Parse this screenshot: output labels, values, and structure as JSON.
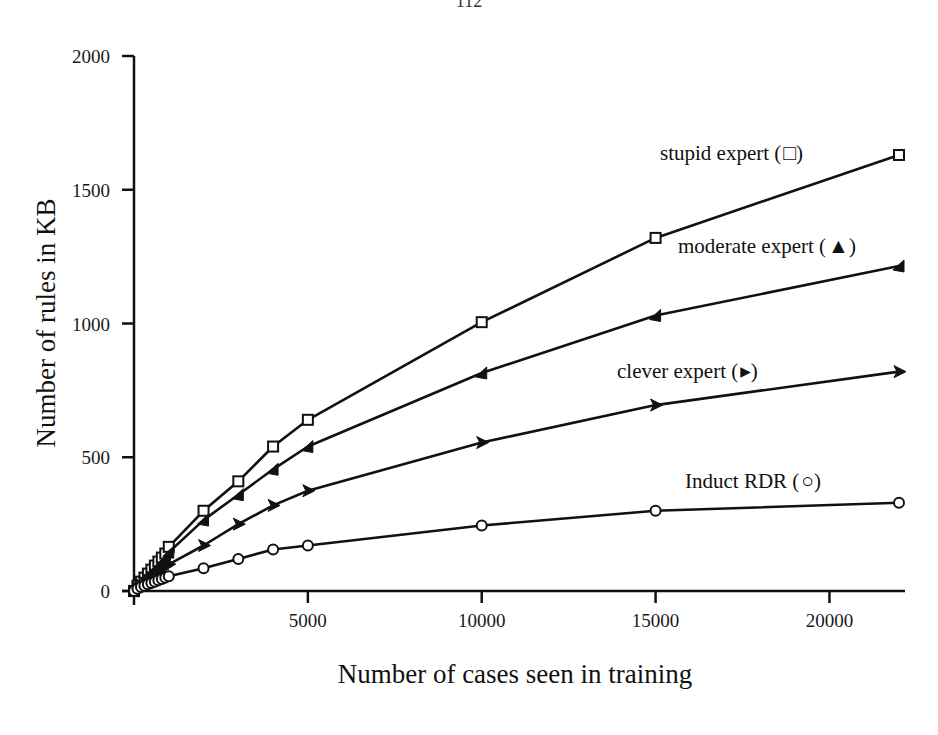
{
  "page": {
    "number": "112"
  },
  "chart_data": {
    "type": "line",
    "title": "",
    "xlabel": "Number of cases seen in training",
    "ylabel": "Number of rules in KB",
    "xlim": [
      0,
      22000
    ],
    "ylim": [
      0,
      2000
    ],
    "xticks": [
      5000,
      10000,
      15000,
      20000
    ],
    "xtick_labels": [
      "5000",
      "10000",
      "15000",
      "20000"
    ],
    "yticks": [
      0,
      500,
      1000,
      1500,
      2000
    ],
    "ytick_labels": [
      "0",
      "500",
      "1000",
      "1500",
      "2000"
    ],
    "grid": false,
    "legend_position": "inline labels at right of each line",
    "series": [
      {
        "name": "stupid expert",
        "label": "stupid expert (□)",
        "marker": "square",
        "x": [
          0,
          100,
          200,
          300,
          400,
          500,
          600,
          700,
          800,
          900,
          1000,
          2000,
          3000,
          4000,
          5000,
          10000,
          15000,
          22000
        ],
        "y": [
          0,
          20,
          35,
          50,
          65,
          80,
          95,
          110,
          125,
          140,
          165,
          300,
          410,
          540,
          640,
          1005,
          1320,
          1630
        ]
      },
      {
        "name": "moderate expert",
        "label": "moderate expert (▲)",
        "marker": "triangle-left-filled",
        "x": [
          0,
          100,
          200,
          300,
          400,
          500,
          600,
          700,
          800,
          900,
          1000,
          2000,
          3000,
          4000,
          5000,
          10000,
          15000,
          22000
        ],
        "y": [
          0,
          18,
          32,
          45,
          58,
          72,
          85,
          98,
          112,
          125,
          145,
          265,
          360,
          455,
          540,
          815,
          1030,
          1215
        ]
      },
      {
        "name": "clever expert",
        "label": "clever expert (▶)",
        "marker": "triangle-right-filled",
        "x": [
          0,
          100,
          200,
          300,
          400,
          500,
          600,
          700,
          800,
          900,
          1000,
          2000,
          3000,
          4000,
          5000,
          10000,
          15000,
          22000
        ],
        "y": [
          0,
          12,
          22,
          32,
          42,
          52,
          62,
          72,
          82,
          92,
          100,
          170,
          250,
          320,
          375,
          555,
          695,
          820
        ]
      },
      {
        "name": "Induct RDR",
        "label": "Induct RDR (○)",
        "marker": "circle",
        "x": [
          0,
          100,
          200,
          300,
          400,
          500,
          600,
          700,
          800,
          900,
          1000,
          2000,
          3000,
          4000,
          5000,
          10000,
          15000,
          22000
        ],
        "y": [
          0,
          8,
          15,
          20,
          25,
          30,
          35,
          40,
          45,
          50,
          55,
          85,
          120,
          155,
          170,
          245,
          300,
          330
        ]
      }
    ]
  },
  "labels": {
    "stupid": "stupid expert (",
    "moderate": "moderate expert (",
    "clever": "clever expert (",
    "induct": "Induct RDR (",
    "close": ")"
  }
}
